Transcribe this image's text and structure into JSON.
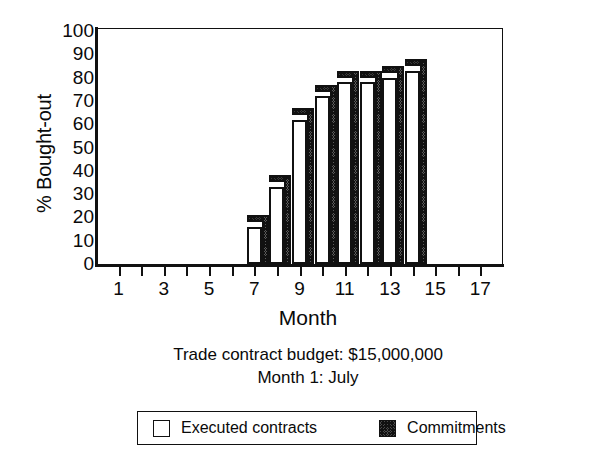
{
  "chart_data": {
    "type": "bar",
    "title": "",
    "xlabel": "Month",
    "ylabel": "% Bought-out",
    "xlim": [
      0,
      18
    ],
    "ylim": [
      0,
      100
    ],
    "grid": false,
    "x_tick_labels": [
      "1",
      "3",
      "5",
      "7",
      "9",
      "11",
      "13",
      "15",
      "17"
    ],
    "x_tick_values": [
      1,
      3,
      5,
      7,
      9,
      11,
      13,
      15,
      17
    ],
    "x_minor_tick_values": [
      2,
      4,
      6,
      8,
      10,
      12,
      14,
      16
    ],
    "y_tick_labels": [
      "0",
      "10",
      "20",
      "30",
      "40",
      "50",
      "60",
      "70",
      "80",
      "90",
      "100"
    ],
    "y_tick_values": [
      0,
      10,
      20,
      30,
      40,
      50,
      60,
      70,
      80,
      90,
      100
    ],
    "categories": [
      7,
      8,
      9,
      10,
      11,
      12,
      13,
      14
    ],
    "series": [
      {
        "name": "Executed contracts",
        "values": [
          16,
          33,
          62,
          72,
          78,
          78,
          80,
          83
        ]
      },
      {
        "name": "Commitments",
        "values": [
          18,
          35,
          64,
          74,
          80,
          80,
          82,
          85
        ]
      }
    ],
    "legend_position": "bottom",
    "annotations": [
      "Trade contract budget: $15,000,000",
      "Month 1: July"
    ]
  },
  "axes": {
    "y_title": "% Bought-out",
    "x_title": "Month"
  },
  "captions": {
    "budget": "Trade contract budget: $15,000,000",
    "start_month": "Month 1: July"
  },
  "legend": {
    "entries": [
      {
        "label": "Executed contracts",
        "swatch": "white-square"
      },
      {
        "label": "Commitments",
        "swatch": "hatched-square"
      }
    ]
  },
  "colors": {
    "axis": "#111111",
    "bar_front": "#ffffff",
    "bar_shade": "#3a3a3a",
    "background": "#ffffff"
  }
}
